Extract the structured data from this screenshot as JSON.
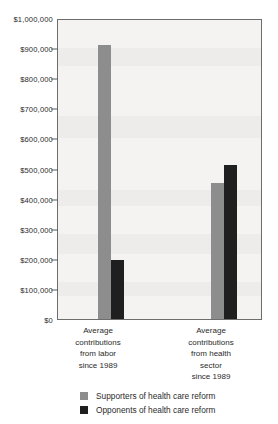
{
  "chart_data": {
    "type": "bar",
    "title": "",
    "subtitle": "",
    "xlabel": "",
    "ylabel": "",
    "ylim": [
      0,
      1000000
    ],
    "grid": false,
    "legend_position": "bottom",
    "categories": [
      "Average contributions from labor since 1989",
      "Average contributions from health sector since 1989"
    ],
    "category_lines": [
      [
        "Average",
        "contributions",
        "from labor",
        "since 1989"
      ],
      [
        "Average",
        "contributions",
        "from health",
        "sector",
        "since 1989"
      ]
    ],
    "series": [
      {
        "name": "Supporters of health care reform",
        "color": "#8d8d8d",
        "values": [
          910000,
          452000
        ]
      },
      {
        "name": "Opponents of health care reform",
        "color": "#1f1f1f",
        "values": [
          197000,
          513000
        ]
      }
    ],
    "y_ticks": [
      0,
      100000,
      200000,
      300000,
      400000,
      500000,
      600000,
      700000,
      800000,
      900000,
      1000000
    ],
    "y_tick_labels": [
      "$0",
      "$100,000",
      "$200,000",
      "$300,000",
      "$400,000",
      "$500,000",
      "$600,000",
      "$700,000",
      "$800,000",
      "$900,000",
      "$1,000,000"
    ]
  },
  "legend": {
    "items": [
      {
        "label": "Supporters of health care reform",
        "color": "#8d8d8d"
      },
      {
        "label": "Opponents of health care reform",
        "color": "#1f1f1f"
      }
    ]
  },
  "colors": {
    "supporters": "#8d8d8d",
    "opponents": "#1f1f1f",
    "plot_background": "#f4f3f1",
    "frame": "#6d6d6d",
    "text": "#2b2b2b"
  }
}
